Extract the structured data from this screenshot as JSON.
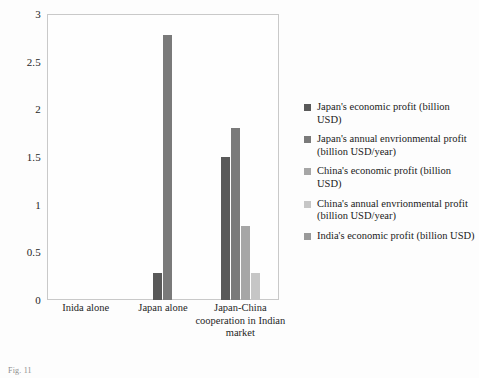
{
  "chart_data": {
    "type": "bar",
    "title": "",
    "xlabel": "",
    "ylabel": "",
    "ylim": [
      0,
      3
    ],
    "yticks": [
      "0",
      "0.5",
      "1",
      "1.5",
      "2",
      "2.5",
      "3"
    ],
    "grid": false,
    "legend_position": "right",
    "categories": [
      "Inida alone",
      "Japan alone",
      "Japan-China cooperation in Indian market"
    ],
    "series": [
      {
        "name": "Japan's economic profit (billion USD)",
        "color": "#595959",
        "values": [
          null,
          0.28,
          1.5
        ]
      },
      {
        "name": "Japan's annual envrionmental profit (billion USD/year)",
        "color": "#7a7a7a",
        "values": [
          null,
          2.78,
          1.8
        ]
      },
      {
        "name": "China's economic profit (billion USD)",
        "color": "#a6a6a6",
        "values": [
          null,
          null,
          0.78
        ]
      },
      {
        "name": "China's annual envrionmental profit (billion USD/year)",
        "color": "#c6c6c6",
        "values": [
          null,
          null,
          0.28
        ]
      },
      {
        "name": "India's economic profit (billion USD)",
        "color": "#9a9a9a",
        "values": [
          null,
          null,
          null
        ]
      }
    ]
  },
  "legend": {
    "items": [
      {
        "label": "Japan's economic profit (billion USD)",
        "color": "#595959"
      },
      {
        "label": "Japan's annual envrionmental profit (billion USD/year)",
        "color": "#7a7a7a"
      },
      {
        "label": "China's economic profit (billion USD)",
        "color": "#a6a6a6"
      },
      {
        "label": "China's annual envrionmental profit (billion USD/year)",
        "color": "#c6c6c6"
      },
      {
        "label": "India's economic profit (billion USD)",
        "color": "#9a9a9a"
      }
    ]
  },
  "caption": {
    "text": "Fig. 11"
  }
}
